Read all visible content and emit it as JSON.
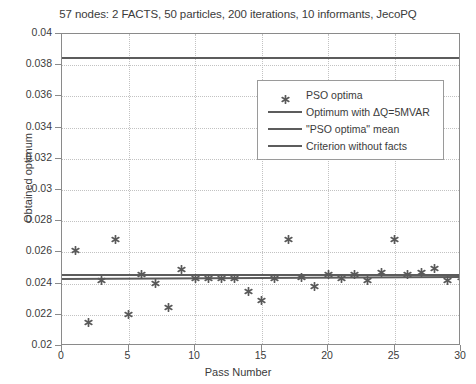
{
  "chart_data": {
    "type": "scatter",
    "title": "57 nodes: 2 FACTS, 50 particles, 200 iterations, 10 informants, JecoPQ",
    "xlabel": "Pass Number",
    "ylabel": "Obtained optimum",
    "xlim": [
      0,
      30
    ],
    "ylim": [
      0.02,
      0.04
    ],
    "xticks": [
      0,
      5,
      10,
      15,
      20,
      25,
      30
    ],
    "yticks": [
      0.02,
      0.022,
      0.024,
      0.026,
      0.028,
      0.03,
      0.032,
      0.034,
      0.036,
      0.038,
      0.04
    ],
    "xticklabels": [
      "0",
      "5",
      "10",
      "15",
      "20",
      "25",
      "30"
    ],
    "yticklabels": [
      "0.02",
      "0.022",
      "0.024",
      "0.026",
      "0.028",
      "0.03",
      "0.032",
      "0.034",
      "0.036",
      "0.038",
      "0.04"
    ],
    "grid": true,
    "legend_position": "upper right",
    "marker_color": "#595959",
    "line_color": "#5c5c5c",
    "series": [
      {
        "name": "PSO optima",
        "type": "scatter",
        "marker": "asterisk",
        "x": [
          1,
          2,
          3,
          4,
          5,
          6,
          7,
          8,
          9,
          10,
          11,
          12,
          13,
          14,
          15,
          16,
          17,
          18,
          19,
          20,
          21,
          22,
          23,
          24,
          25,
          26,
          27,
          28,
          29,
          30
        ],
        "y": [
          0.0261,
          0.0215,
          0.0242,
          0.0268,
          0.022,
          0.0246,
          0.024,
          0.0225,
          0.0249,
          0.0243,
          0.0243,
          0.0243,
          0.0243,
          0.0235,
          0.0229,
          0.0243,
          0.0268,
          0.0244,
          0.0238,
          0.0246,
          0.0243,
          0.0246,
          0.0242,
          0.0247,
          0.0268,
          0.0246,
          0.0247,
          0.025,
          0.0242,
          0.0244
        ]
      },
      {
        "name": "Optimum with ΔQ=5MVAR",
        "type": "hline",
        "value": 0.02455,
        "value_left": 0.02455,
        "value_right": 0.02455
      },
      {
        "name": "\"PSO optima\" mean",
        "type": "hline",
        "value": 0.02432,
        "value_left": 0.02428,
        "value_right": 0.0244
      },
      {
        "name": "Criterion without facts",
        "type": "hline",
        "value": 0.03847,
        "value_left": 0.03847,
        "value_right": 0.03847
      }
    ]
  },
  "legend": {
    "items": [
      {
        "label": "PSO optima",
        "symbol": "asterisk-marker"
      },
      {
        "label": "Optimum with ΔQ=5MVAR",
        "symbol": "line"
      },
      {
        "label": "\"PSO optima\" mean",
        "symbol": "line"
      },
      {
        "label": "Criterion without facts",
        "symbol": "line"
      }
    ]
  }
}
